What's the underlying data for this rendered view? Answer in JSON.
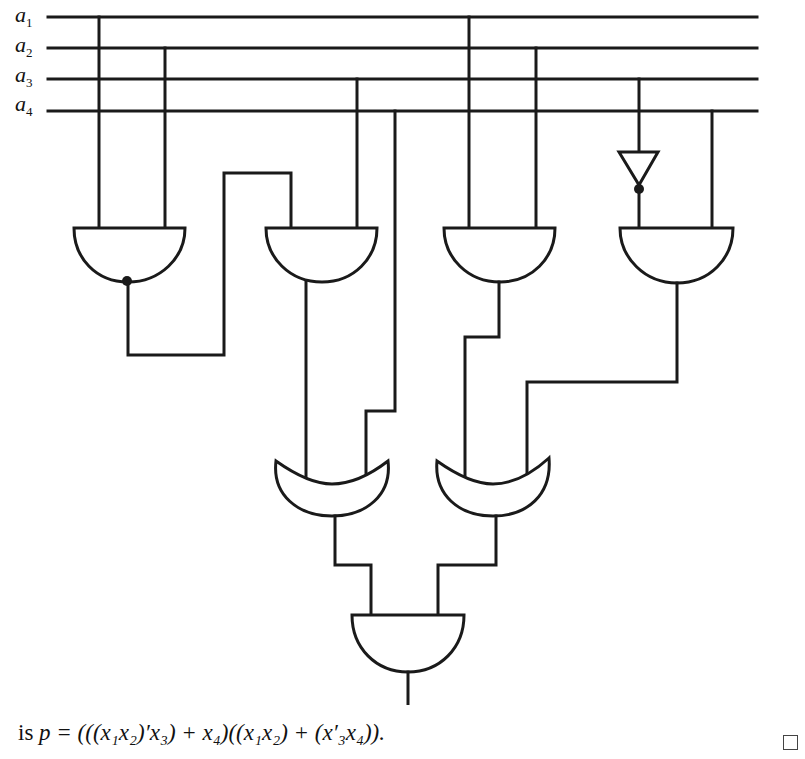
{
  "diagram": {
    "type": "logic-circuit",
    "inputs": [
      {
        "name": "a1",
        "base": "a",
        "sub": "1"
      },
      {
        "name": "a2",
        "base": "a",
        "sub": "2"
      },
      {
        "name": "a3",
        "base": "a",
        "sub": "3"
      },
      {
        "name": "a4",
        "base": "a",
        "sub": "4"
      }
    ],
    "gates": [
      {
        "id": "g1",
        "kind": "NAND",
        "inputs": [
          "a1",
          "a2"
        ]
      },
      {
        "id": "g2",
        "kind": "AND",
        "inputs": [
          "g1",
          "a3"
        ]
      },
      {
        "id": "g3",
        "kind": "AND",
        "inputs": [
          "a1",
          "a2"
        ]
      },
      {
        "id": "inv",
        "kind": "NOT",
        "inputs": [
          "a3"
        ]
      },
      {
        "id": "g4",
        "kind": "AND",
        "inputs": [
          "inv",
          "a4"
        ]
      },
      {
        "id": "or1",
        "kind": "OR",
        "inputs": [
          "g2",
          "a4"
        ]
      },
      {
        "id": "or2",
        "kind": "OR",
        "inputs": [
          "g3",
          "g4"
        ]
      },
      {
        "id": "out",
        "kind": "AND",
        "inputs": [
          "or1",
          "or2"
        ]
      }
    ],
    "colors": {
      "ink": "#1a1a1a",
      "background": "#ffffff"
    }
  },
  "caption": {
    "prefix": "is ",
    "expression": "p = (((x₁x₂)′x₃) + x₄)((x₁x₂) + (x′₃x₄)).",
    "end_mark": "qed-square"
  }
}
